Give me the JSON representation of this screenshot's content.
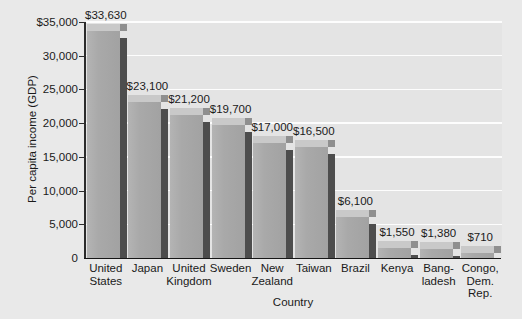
{
  "chart_data": {
    "type": "bar",
    "title": "",
    "xlabel": "Country",
    "ylabel": "Per capita income (GDP)",
    "ylim": [
      0,
      35000
    ],
    "yticks": [
      0,
      5000,
      10000,
      15000,
      20000,
      25000,
      30000,
      35000
    ],
    "ytick_labels": [
      "0",
      "5,000",
      "10,000",
      "15,000",
      "20,000",
      "25,000",
      "30,000",
      "$35,000"
    ],
    "grid": true,
    "legend": "none",
    "categories": [
      "United\nStates",
      "Japan",
      "United\nKingdom",
      "Sweden",
      "New\nZealand",
      "Taiwan",
      "Brazil",
      "Kenya",
      "Bang-\nladesh",
      "Congo,\nDem.\nRep."
    ],
    "values": [
      33630,
      23100,
      21200,
      19700,
      17000,
      16500,
      6100,
      1550,
      1380,
      710
    ],
    "value_labels": [
      "$33,630",
      "$23,100",
      "$21,200",
      "$19,700",
      "$17,000",
      "$16,500",
      "$6,100",
      "$1,550",
      "$1,380",
      "$710"
    ]
  },
  "colors": {
    "page_background": "#e9e9e9",
    "plot_background": "#e4e4e4",
    "bar_front": "#a9a9a9",
    "bar_top": "#c9c9c9",
    "bar_side": "#4d4d4d",
    "gridline": "#fdfdfd",
    "axis": "#2b2b2b",
    "text": "#1a1a1a"
  }
}
